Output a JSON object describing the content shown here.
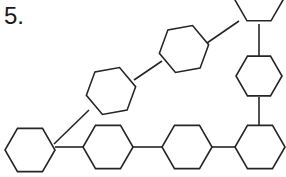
{
  "figure": {
    "label": "5.",
    "kind": "chemical-structure-skeletal-diagram",
    "background_color": "#ffffff",
    "stroke_color": "#262626",
    "stroke_width": 1.6,
    "ring_count": 8,
    "bond_count": 7,
    "rings": [
      {
        "id": "ring-1",
        "name": "hexagon-bottom-left",
        "center_x": 30,
        "center_y": 150,
        "radius": 25,
        "rotation_deg": 0,
        "clipped_edge": "bottom"
      },
      {
        "id": "ring-2",
        "name": "hexagon-bottom-second",
        "center_x": 108,
        "center_y": 147,
        "radius": 25,
        "rotation_deg": 0,
        "clipped_edge": "none"
      },
      {
        "id": "ring-3",
        "name": "hexagon-bottom-third",
        "center_x": 187,
        "center_y": 147,
        "radius": 25,
        "rotation_deg": 0,
        "clipped_edge": "none"
      },
      {
        "id": "ring-4",
        "name": "hexagon-bottom-right",
        "center_x": 260,
        "center_y": 147,
        "radius": 25,
        "rotation_deg": 0,
        "clipped_edge": "none"
      },
      {
        "id": "ring-5",
        "name": "hexagon-right-middle",
        "center_x": 259,
        "center_y": 76,
        "radius": 23,
        "rotation_deg": 0,
        "clipped_edge": "none"
      },
      {
        "id": "ring-6",
        "name": "hexagon-top-right",
        "center_x": 259,
        "center_y": 0,
        "radius": 24,
        "rotation_deg": 0,
        "clipped_edge": "top"
      },
      {
        "id": "ring-7",
        "name": "hexagon-middle-left-diagonal",
        "center_x": 111,
        "center_y": 91,
        "radius": 25,
        "rotation_deg": -10,
        "clipped_edge": "none"
      },
      {
        "id": "ring-8",
        "name": "hexagon-upper-middle-diagonal",
        "center_x": 184,
        "center_y": 49,
        "radius": 25,
        "rotation_deg": -10,
        "clipped_edge": "none"
      }
    ],
    "bonds": [
      {
        "id": "bond-1",
        "name": "bond-ring1-ring2",
        "x1": 55,
        "y1": 147,
        "x2": 83,
        "y2": 147,
        "orientation": "horizontal"
      },
      {
        "id": "bond-2",
        "name": "bond-ring2-ring3",
        "x1": 133,
        "y1": 147,
        "x2": 162,
        "y2": 147,
        "orientation": "horizontal"
      },
      {
        "id": "bond-3",
        "name": "bond-ring3-ring4",
        "x1": 212,
        "y1": 147,
        "x2": 236,
        "y2": 147,
        "orientation": "horizontal"
      },
      {
        "id": "bond-4",
        "name": "bond-ring4-ring5",
        "x1": 259,
        "y1": 125,
        "x2": 259,
        "y2": 97,
        "orientation": "vertical"
      },
      {
        "id": "bond-5",
        "name": "bond-ring5-ring6",
        "x1": 259,
        "y1": 56,
        "x2": 259,
        "y2": 24,
        "orientation": "vertical"
      },
      {
        "id": "bond-6",
        "name": "bond-ring1-ring7",
        "x1": 54,
        "y1": 144,
        "x2": 89,
        "y2": 110,
        "orientation": "diagonal-up-right"
      },
      {
        "id": "bond-7",
        "name": "bond-ring7-ring8",
        "x1": 134,
        "y1": 80,
        "x2": 162,
        "y2": 61,
        "orientation": "diagonal-up-right"
      },
      {
        "id": "bond-8",
        "name": "bond-ring8-ring6",
        "x1": 207,
        "y1": 43,
        "x2": 239,
        "y2": 21,
        "orientation": "diagonal-up-right"
      }
    ]
  }
}
